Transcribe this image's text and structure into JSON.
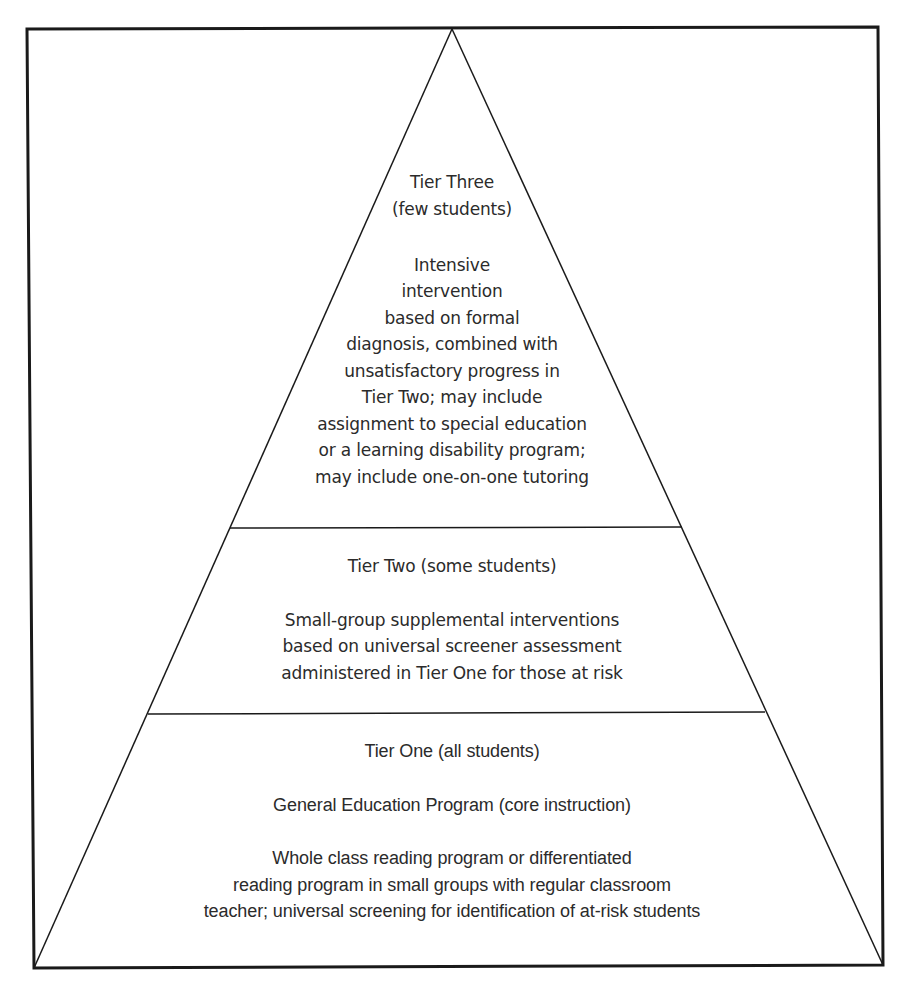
{
  "diagram": {
    "type": "pyramid",
    "colors": {
      "stroke": "#1a1a1a",
      "text": "#2b2b2b",
      "background": "#ffffff"
    },
    "tiers": [
      {
        "name": "Tier Three",
        "heading_lines": [
          "Tier Three",
          "(few students)"
        ],
        "body_lines": [
          "Intensive",
          "intervention",
          "based on formal",
          "diagnosis, combined with",
          "unsatisfactory progress in",
          "Tier Two; may include",
          "assignment to special education",
          "or a learning disability program;",
          "may include one-on-one tutoring"
        ]
      },
      {
        "name": "Tier Two",
        "heading_lines": [
          "Tier Two (some students)"
        ],
        "body_lines": [
          "Small-group supplemental interventions",
          "based on universal screener assessment",
          "administered in Tier One for those at risk"
        ]
      },
      {
        "name": "Tier One",
        "heading_lines": [
          "Tier One (all students)"
        ],
        "subheading": "General Education Program (core instruction)",
        "body_lines": [
          "Whole class reading program or differentiated",
          "reading program in small groups with regular classroom",
          "teacher; universal screening for identification of at-risk students"
        ]
      }
    ]
  }
}
